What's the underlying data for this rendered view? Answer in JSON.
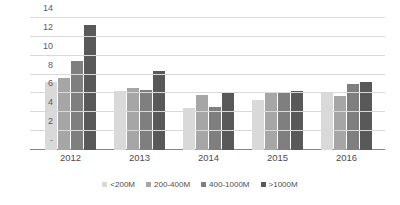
{
  "chart_data": {
    "type": "bar",
    "title": "",
    "xlabel": "",
    "ylabel": "",
    "categories": [
      "2012",
      "2013",
      "2014",
      "2015",
      "2016"
    ],
    "series": [
      {
        "name": "<200M",
        "color": "#d9d9d9",
        "values": [
          7.2,
          6.3,
          4.5,
          5.3,
          6.0
        ]
      },
      {
        "name": "200-400M",
        "color": "#a6a6a6",
        "values": [
          7.6,
          6.6,
          5.8,
          6.1,
          5.7
        ]
      },
      {
        "name": "400-1000M",
        "color": "#7f7f7f",
        "values": [
          9.4,
          6.4,
          4.6,
          6.1,
          7.0
        ]
      },
      {
        "name": ">1000M",
        "color": "#595959",
        "values": [
          13.3,
          8.4,
          6.0,
          6.3,
          7.2
        ]
      }
    ],
    "ylim": [
      0,
      14
    ],
    "yticks": [
      "-",
      "2",
      "4",
      "6",
      "8",
      "10",
      "12",
      "14"
    ],
    "ytick_values": [
      0,
      2,
      4,
      6,
      8,
      10,
      12,
      14
    ],
    "grid": true,
    "legend_position": "bottom"
  },
  "colors": {
    "gridline": "#d9d9d9",
    "axis": "#868686",
    "tick_text": "#5a5a5a",
    "label_text": "#4d4d4d",
    "background": "#ffffff"
  }
}
